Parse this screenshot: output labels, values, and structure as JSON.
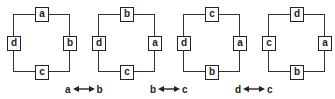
{
  "panels": [
    {
      "top": "a",
      "left": "d",
      "right": "b",
      "bottom": "c"
    },
    {
      "top": "b",
      "left": "d",
      "right": "a",
      "bottom": "c"
    },
    {
      "top": "c",
      "left": "d",
      "right": "a",
      "bottom": "b"
    },
    {
      "top": "d",
      "left": "c",
      "right": "a",
      "bottom": "b"
    }
  ],
  "swaps": [
    {
      "from": "a",
      "to": "b"
    },
    {
      "from": "b",
      "to": "c"
    },
    {
      "from": "d",
      "to": "c"
    }
  ]
}
